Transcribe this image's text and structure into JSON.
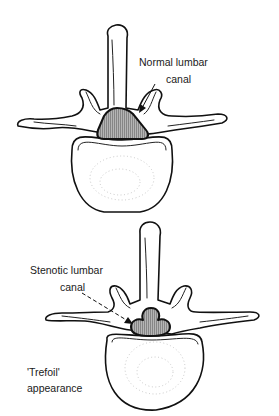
{
  "diagram": {
    "top_vertebra": {
      "label_line1": "Normal lumbar",
      "label_line2": "canal",
      "canal_shape": "triangle",
      "arrow_style": "solid"
    },
    "bottom_vertebra": {
      "label_line1": "Stenotic lumbar",
      "label_line2": "canal",
      "canal_shape": "trefoil",
      "arrow_style": "dashed",
      "note_line1": "'Trefoil'",
      "note_line2": "appearance"
    },
    "colors": {
      "line": "#111111",
      "canal_fill": "#a8a8a8",
      "background": "#ffffff"
    }
  }
}
